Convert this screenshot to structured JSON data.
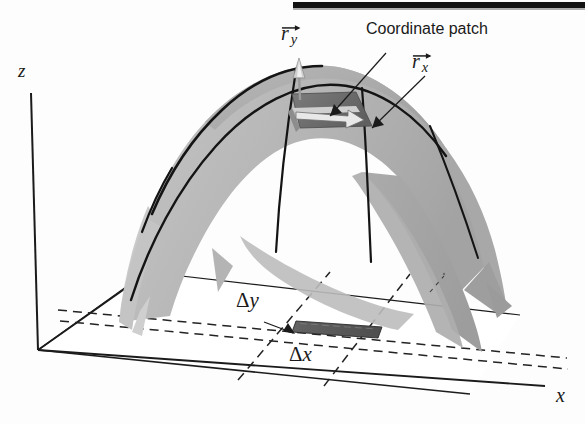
{
  "figure": {
    "title_bar": {
      "present": true,
      "color": "#121212"
    },
    "background": "#fdfdfd",
    "surface_color": "#b9b9b9",
    "surface_shade_light": "#d2d2d2",
    "surface_shade_dark": "#9a9a9a",
    "patch_color": "#6e6e6e",
    "line_color": "#141414"
  },
  "axes": {
    "z_label": "z",
    "x_label": "x",
    "y_label": ""
  },
  "annotations": {
    "coordinate_patch": "Coordinate patch",
    "r_y": {
      "symbol": "r",
      "subscript": "y"
    },
    "r_x": {
      "symbol": "r",
      "subscript": "x"
    },
    "delta_y": {
      "symbol": "Δ",
      "variable": "y"
    },
    "delta_x": {
      "symbol": "Δ",
      "variable": "x"
    }
  }
}
